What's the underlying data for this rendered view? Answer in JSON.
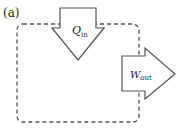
{
  "figure": {
    "panel_label": "(a)",
    "system_boundary": "dashed-rounded-rectangle",
    "arrows": [
      {
        "name": "heat-in",
        "symbol": "Q",
        "subscript": "in",
        "direction": "down"
      },
      {
        "name": "work-out",
        "symbol": "W",
        "subscript": "out",
        "direction": "right"
      }
    ]
  },
  "colors": {
    "stroke": "#555555",
    "fill": "#ffffff",
    "text": "#222222"
  }
}
